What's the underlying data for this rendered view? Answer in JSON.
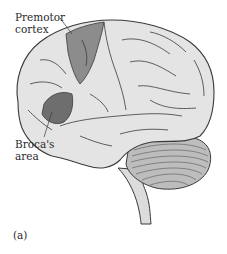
{
  "figure": {
    "panel_label": "(a)",
    "labels": {
      "premotor_line1": "Premotor",
      "premotor_line2": "cortex",
      "broca_line1": "Broca's",
      "broca_line2": "area"
    },
    "colors": {
      "brain_fill": "#e4e4e4",
      "outline": "#3a3a3a",
      "premotor_fill": "#8c8c8c",
      "broca_fill": "#6e6e6e",
      "cerebellum_fill": "#bdbdbd",
      "brainstem_fill": "#dcdcdc",
      "text": "#2a2a2a"
    }
  }
}
